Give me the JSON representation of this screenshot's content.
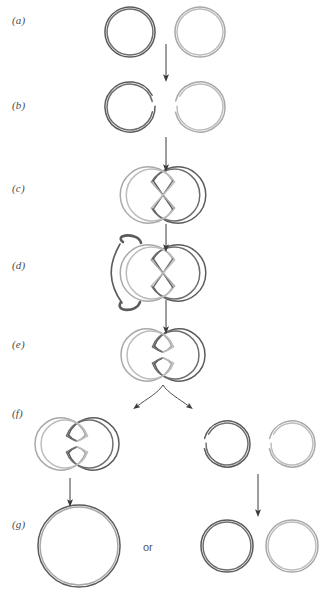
{
  "figure": {
    "type": "process-diagram",
    "background_color": "#ffffff",
    "panel_count": 7
  },
  "colors": {
    "dark_strand": "#5b5b5b",
    "dark_strand_inner": "#6e6e6e",
    "light_strand": "#a8a8a8",
    "light_strand_inner": "#bdbdbd",
    "arrow": "#3a3a3a",
    "label_text": "#4a4a4a",
    "or_text": "#575757",
    "page_background": "#ffffff"
  },
  "panels": [
    {
      "id": "a",
      "label": "(a)",
      "label_x": 12,
      "label_y": 14,
      "caption": "Two separate closed circular DNA molecules",
      "objects": [
        {
          "name": "circle-dark",
          "shade": "dark",
          "cx": 130,
          "cy": 32,
          "r": 24,
          "state": "closed"
        },
        {
          "name": "circle-light",
          "shade": "light",
          "cx": 200,
          "cy": 32,
          "r": 24,
          "state": "closed"
        }
      ]
    },
    {
      "id": "b",
      "label": "(b)",
      "label_x": 12,
      "label_y": 99,
      "caption": "Both circles nicked at the recombination site",
      "objects": [
        {
          "name": "circle-dark-nicked",
          "shade": "dark",
          "cx": 130,
          "cy": 107,
          "r": 24,
          "state": "nicked"
        },
        {
          "name": "circle-light-nicked",
          "shade": "light",
          "cx": 200,
          "cy": 107,
          "r": 24,
          "state": "nicked"
        }
      ]
    },
    {
      "id": "c",
      "label": "(c)",
      "label_x": 12,
      "label_y": 182,
      "caption": "Strands exchanged forming a crossed figure-eight intermediate",
      "objects": [
        {
          "name": "figure-eight-crossed",
          "shade": "mixed",
          "cx": 163,
          "cy": 195,
          "state": "crossed"
        }
      ]
    },
    {
      "id": "d",
      "label": "(d)",
      "label_x": 12,
      "label_y": 259,
      "caption": "Branch migration extends the heteroduplex region",
      "objects": [
        {
          "name": "figure-eight-wrapped",
          "shade": "mixed",
          "cx": 163,
          "cy": 273,
          "state": "crossed-wrapped"
        }
      ]
    },
    {
      "id": "e",
      "label": "(e)",
      "label_x": 12,
      "label_y": 338,
      "caption": "Holliday junction resolved into a pinched figure-eight",
      "objects": [
        {
          "name": "figure-eight-pinched",
          "shade": "mixed",
          "cx": 163,
          "cy": 355,
          "state": "pinched"
        }
      ]
    },
    {
      "id": "f",
      "label": "(f)",
      "label_x": 12,
      "label_y": 407,
      "caption": "Two alternative resolution products",
      "objects": [
        {
          "name": "figure-eight-pinched-left",
          "shade": "mixed",
          "cx": 77,
          "cy": 444,
          "state": "pinched"
        },
        {
          "name": "circle-dark-nicked-right",
          "shade": "dark",
          "cx": 227,
          "cy": 444,
          "r": 22,
          "state": "nicked"
        },
        {
          "name": "circle-light-nicked-right",
          "shade": "light",
          "cx": 292,
          "cy": 444,
          "r": 22,
          "state": "nicked"
        }
      ]
    },
    {
      "id": "g",
      "label": "(g)",
      "label_x": 12,
      "label_y": 518,
      "caption": "Sealed products: one fused large circle, or two separate circles",
      "alternative_text": "or",
      "objects": [
        {
          "name": "circle-fused-large",
          "shade": "mixed",
          "cx": 79,
          "cy": 546,
          "r": 40,
          "state": "closed"
        },
        {
          "name": "circle-dark-small",
          "shade": "dark",
          "cx": 227,
          "cy": 546,
          "r": 25,
          "state": "closed"
        },
        {
          "name": "circle-light-small",
          "shade": "light",
          "cx": 292,
          "cy": 546,
          "r": 25,
          "state": "closed"
        }
      ]
    }
  ],
  "arrows": [
    {
      "name": "arrow-a-to-b",
      "from_panel": "a",
      "to_panel": "b",
      "x": 166,
      "y1": 44,
      "y2": 78,
      "style": "straight-down"
    },
    {
      "name": "arrow-b-to-c",
      "from_panel": "b",
      "to_panel": "c",
      "x": 166,
      "y1": 137,
      "y2": 168,
      "style": "straight-down"
    },
    {
      "name": "arrow-c-to-d",
      "from_panel": "c",
      "to_panel": "d",
      "x": 166,
      "y1": 224,
      "y2": 248,
      "style": "straight-down"
    },
    {
      "name": "arrow-d-to-e",
      "from_panel": "d",
      "to_panel": "e",
      "x": 166,
      "y1": 300,
      "y2": 330,
      "style": "straight-down"
    },
    {
      "name": "arrow-e-to-f-left",
      "from_panel": "e",
      "to_panel": "f",
      "style": "curved-branch-left"
    },
    {
      "name": "arrow-e-to-f-right",
      "from_panel": "e",
      "to_panel": "f",
      "style": "curved-branch-right"
    },
    {
      "name": "arrow-f-to-g-left",
      "from_panel": "f",
      "to_panel": "g",
      "x": 70,
      "y1": 478,
      "y2": 503,
      "style": "straight-down"
    },
    {
      "name": "arrow-f-to-g-right",
      "from_panel": "f",
      "to_panel": "g",
      "x": 258,
      "y1": 474,
      "y2": 513,
      "style": "straight-down"
    }
  ]
}
